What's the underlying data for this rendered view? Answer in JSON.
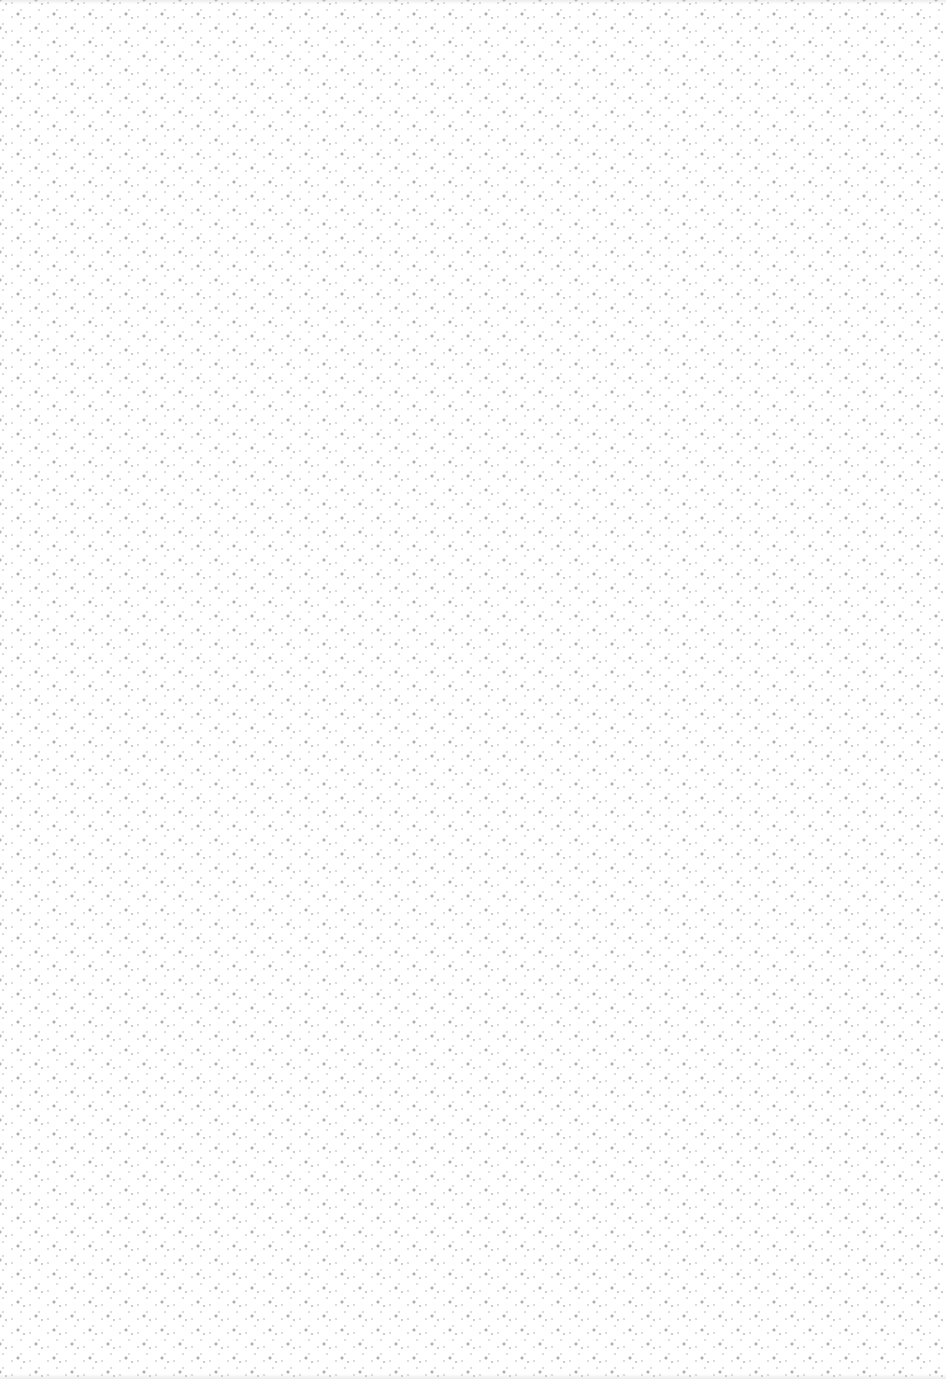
{
  "texture": {
    "type": "dot-pattern",
    "background_color": "#ffffff",
    "dot_color": "#969696",
    "secondary_dot_color": "#b9b9b9",
    "tile_width_px": 36,
    "tile_height_px": 28,
    "layout": "rhombic-lattice"
  }
}
